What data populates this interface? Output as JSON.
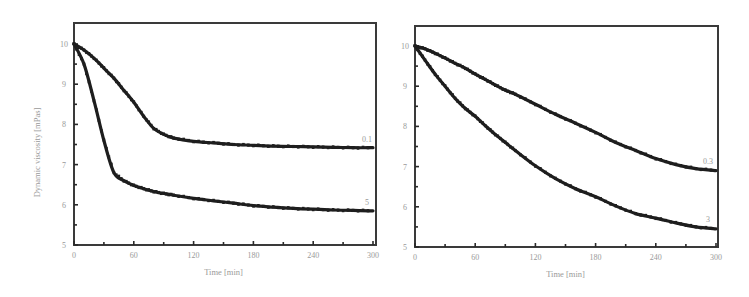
{
  "chart_data": [
    {
      "type": "line",
      "title": "",
      "xlabel": "Time [min]",
      "ylabel": "Dynamic viscosity [mPas]",
      "xlim": [
        0,
        300
      ],
      "ylim": [
        5,
        10.5
      ],
      "x_ticks": [
        "0",
        "60",
        "120",
        "180",
        "240",
        "300"
      ],
      "y_ticks": [
        "5",
        "6",
        "7",
        "8",
        "9",
        "10"
      ],
      "grid": false,
      "legend": "inline labels at curve ends",
      "x": [
        0,
        10,
        20,
        30,
        40,
        50,
        60,
        70,
        80,
        90,
        100,
        120,
        140,
        160,
        180,
        200,
        220,
        240,
        260,
        280,
        300
      ],
      "series": [
        {
          "name": "0.1",
          "values": [
            10.0,
            9.85,
            9.65,
            9.4,
            9.15,
            8.85,
            8.55,
            8.2,
            7.9,
            7.75,
            7.66,
            7.58,
            7.54,
            7.5,
            7.48,
            7.46,
            7.45,
            7.44,
            7.43,
            7.42,
            7.42
          ]
        },
        {
          "name": "5",
          "values": [
            10.0,
            9.5,
            8.6,
            7.6,
            6.8,
            6.6,
            6.48,
            6.4,
            6.33,
            6.28,
            6.24,
            6.16,
            6.1,
            6.04,
            5.98,
            5.94,
            5.91,
            5.89,
            5.87,
            5.86,
            5.85
          ]
        }
      ]
    },
    {
      "type": "line",
      "title": "",
      "xlabel": "Time [min]",
      "ylabel": "",
      "xlim": [
        0,
        300
      ],
      "ylim": [
        5,
        10.5
      ],
      "x_ticks": [
        "0",
        "60",
        "120",
        "180",
        "240",
        "300"
      ],
      "y_ticks": [
        "5",
        "6",
        "7",
        "8",
        "9",
        "10"
      ],
      "grid": false,
      "legend": "inline labels at curve ends",
      "x": [
        0,
        10,
        20,
        30,
        40,
        50,
        60,
        70,
        80,
        90,
        100,
        120,
        140,
        160,
        180,
        200,
        220,
        240,
        260,
        280,
        300
      ],
      "series": [
        {
          "name": "0.3",
          "values": [
            10.0,
            9.93,
            9.82,
            9.7,
            9.57,
            9.45,
            9.3,
            9.17,
            9.03,
            8.9,
            8.8,
            8.55,
            8.3,
            8.08,
            7.85,
            7.6,
            7.4,
            7.2,
            7.05,
            6.95,
            6.9
          ]
        },
        {
          "name": "3",
          "values": [
            10.0,
            9.65,
            9.3,
            9.0,
            8.7,
            8.45,
            8.25,
            8.02,
            7.8,
            7.6,
            7.4,
            7.02,
            6.7,
            6.45,
            6.25,
            6.02,
            5.83,
            5.72,
            5.6,
            5.5,
            5.45
          ]
        }
      ]
    }
  ],
  "panels": [
    {
      "xlabel": "Time [min]",
      "ylabel": "Dynamic viscosity [mPas]"
    },
    {
      "xlabel": "Time [min]",
      "ylabel": ""
    }
  ]
}
